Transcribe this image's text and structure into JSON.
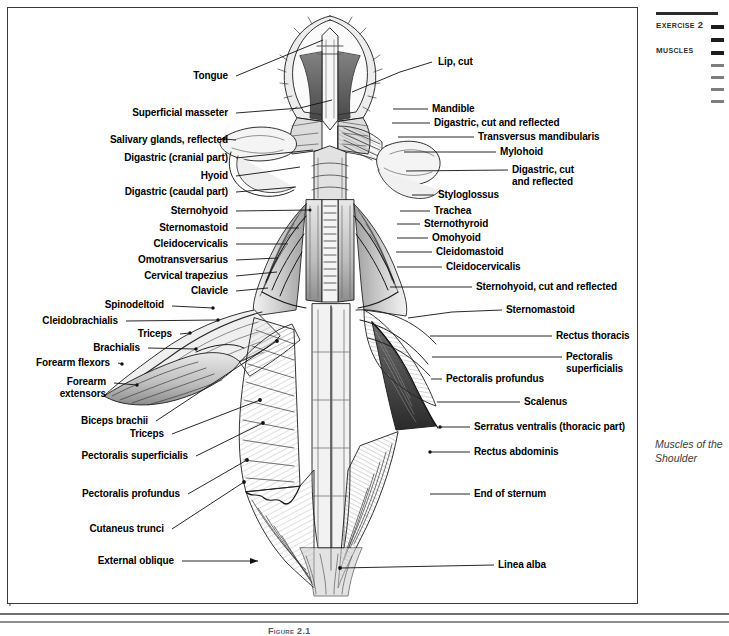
{
  "margin": {
    "exercise": "Exercise 2",
    "section": "Muscles",
    "side_caption": "Muscles of the Shoulder"
  },
  "figure": {
    "caption": "Figure 2.1",
    "title": "Muscles of the Shoulder"
  },
  "labels_left": [
    {
      "id": "tongue",
      "text": "Tongue",
      "x": 228,
      "y": 76,
      "tip_x": 323,
      "tip_y": 40
    },
    {
      "id": "superficial-masseter",
      "text": "Superficial masseter",
      "x": 228,
      "y": 113,
      "tip_x": 330,
      "tip_y": 100
    },
    {
      "id": "salivary-glands",
      "text": "Salivary glands, reflected",
      "x": 228,
      "y": 140,
      "tip_x": 224,
      "tip_y": 138
    },
    {
      "id": "digastric-cranial",
      "text": "Digastric (cranial part)",
      "x": 228,
      "y": 158,
      "tip_x": 313,
      "tip_y": 150
    },
    {
      "id": "hyoid",
      "text": "Hyoid",
      "x": 228,
      "y": 176,
      "tip_x": 299,
      "tip_y": 167
    },
    {
      "id": "digastric-caudal",
      "text": "Digastric (caudal part)",
      "x": 228,
      "y": 192,
      "tip_x": 296,
      "tip_y": 187
    },
    {
      "id": "sternohyoid-l",
      "text": "Sternohyoid",
      "x": 228,
      "y": 211,
      "tip_x": 310,
      "tip_y": 210
    },
    {
      "id": "sternomastoid-l",
      "text": "Sternomastoid",
      "x": 228,
      "y": 228,
      "tip_x": 299,
      "tip_y": 228
    },
    {
      "id": "cleidocervicalis-l",
      "text": "Cleidocervicalis",
      "x": 228,
      "y": 244,
      "tip_x": 288,
      "tip_y": 244
    },
    {
      "id": "omotransversarius",
      "text": "Omotransversarius",
      "x": 228,
      "y": 260,
      "tip_x": 278,
      "tip_y": 258
    },
    {
      "id": "cervical-trapezius",
      "text": "Cervical trapezius",
      "x": 228,
      "y": 276,
      "tip_x": 277,
      "tip_y": 272
    },
    {
      "id": "clavicle",
      "text": "Clavicle",
      "x": 228,
      "y": 291,
      "tip_x": 268,
      "tip_y": 288
    },
    {
      "id": "spinodeltoid",
      "text": "Spinodeltoid",
      "x": 164,
      "y": 305,
      "tip_x": 213,
      "tip_y": 307
    },
    {
      "id": "cleidobrachialis",
      "text": "Cleidobrachialis",
      "x": 118,
      "y": 321,
      "tip_x": 218,
      "tip_y": 320
    },
    {
      "id": "triceps-upper",
      "text": "Triceps",
      "x": 172,
      "y": 334,
      "tip_x": 185,
      "tip_y": 333
    },
    {
      "id": "brachialis",
      "text": "Brachialis",
      "x": 140,
      "y": 348,
      "tip_x": 196,
      "tip_y": 349
    },
    {
      "id": "forearm-flexors",
      "text": "Forearm flexors",
      "x": 110,
      "y": 363,
      "tip_x": 120,
      "tip_y": 364
    },
    {
      "id": "forearm-extensors",
      "text": "Forearm\nextensors",
      "x": 106,
      "y": 382,
      "tip_x": 137,
      "tip_y": 385
    },
    {
      "id": "biceps-brachii",
      "text": "Biceps brachii",
      "x": 148,
      "y": 421,
      "tip_x": 277,
      "tip_y": 341
    },
    {
      "id": "triceps-lower",
      "text": "Triceps",
      "x": 164,
      "y": 434,
      "tip_x": 260,
      "tip_y": 400
    },
    {
      "id": "pectoralis-superficialis-l",
      "text": "Pectoralis superficialis",
      "x": 188,
      "y": 456,
      "tip_x": 263,
      "tip_y": 423
    },
    {
      "id": "pectoralis-profundus-l",
      "text": "Pectoralis profundus",
      "x": 180,
      "y": 494,
      "tip_x": 247,
      "tip_y": 460
    },
    {
      "id": "cutaneus-trunci",
      "text": "Cutaneus trunci",
      "x": 164,
      "y": 529,
      "tip_x": 244,
      "tip_y": 482
    },
    {
      "id": "external-oblique",
      "text": "External oblique",
      "x": 174,
      "y": 561,
      "tip_x": 258,
      "tip_y": 561
    }
  ],
  "labels_right": [
    {
      "id": "lip-cut",
      "text": "Lip, cut",
      "x": 438,
      "y": 62,
      "tip_x": 352,
      "tip_y": 92
    },
    {
      "id": "mandible",
      "text": "Mandible",
      "x": 432,
      "y": 109,
      "tip_x": 393,
      "tip_y": 109
    },
    {
      "id": "digastric-cut-1",
      "text": "Digastric, cut and reflected",
      "x": 434,
      "y": 123,
      "tip_x": 392,
      "tip_y": 123
    },
    {
      "id": "transversus-mandibularis",
      "text": "Transversus mandibularis",
      "x": 478,
      "y": 137,
      "tip_x": 398,
      "tip_y": 137
    },
    {
      "id": "mylohoid",
      "text": "Mylohoid",
      "x": 500,
      "y": 152,
      "tip_x": 404,
      "tip_y": 152
    },
    {
      "id": "digastric-cut-2",
      "text": "Digastric, cut\nand reflected",
      "x": 512,
      "y": 170,
      "tip_x": 406,
      "tip_y": 171
    },
    {
      "id": "styloglossus",
      "text": "Styloglossus",
      "x": 438,
      "y": 195,
      "tip_x": 412,
      "tip_y": 195
    },
    {
      "id": "trachea",
      "text": "Trachea",
      "x": 434,
      "y": 211,
      "tip_x": 400,
      "tip_y": 211
    },
    {
      "id": "sternothyroid",
      "text": "Sternothyroid",
      "x": 424,
      "y": 224,
      "tip_x": 397,
      "tip_y": 224
    },
    {
      "id": "omohyoid",
      "text": "Omohyoid",
      "x": 432,
      "y": 238,
      "tip_x": 397,
      "tip_y": 238
    },
    {
      "id": "cleidomastoid",
      "text": "Cleidomastoid",
      "x": 436,
      "y": 252,
      "tip_x": 396,
      "tip_y": 252
    },
    {
      "id": "cleidocervicalis-r",
      "text": "Cleidocervicalis",
      "x": 446,
      "y": 267,
      "tip_x": 397,
      "tip_y": 267
    },
    {
      "id": "sternohyoid-cut",
      "text": "Sternohyoid, cut and reflected",
      "x": 476,
      "y": 287,
      "tip_x": 390,
      "tip_y": 287
    },
    {
      "id": "sternomastoid-r",
      "text": "Sternomastoid",
      "x": 506,
      "y": 310,
      "tip_x": 408,
      "tip_y": 316
    },
    {
      "id": "rectus-thoracis",
      "text": "Rectus thoracis",
      "x": 556,
      "y": 336,
      "tip_x": 430,
      "tip_y": 336
    },
    {
      "id": "pectoralis-superficialis-r",
      "text": "Pectoralis\nsuperficialis",
      "x": 566,
      "y": 357,
      "tip_x": 432,
      "tip_y": 357
    },
    {
      "id": "pectoralis-profundus-r",
      "text": "Pectoralis profundus",
      "x": 446,
      "y": 379,
      "tip_x": 431,
      "tip_y": 379
    },
    {
      "id": "scalenus",
      "text": "Scalenus",
      "x": 524,
      "y": 402,
      "tip_x": 437,
      "tip_y": 402
    },
    {
      "id": "serratus-ventralis",
      "text": "Serratus ventralis (thoracic part)",
      "x": 474,
      "y": 427,
      "tip_x": 440,
      "tip_y": 427
    },
    {
      "id": "rectus-abdominis",
      "text": "Rectus abdominis",
      "x": 474,
      "y": 452,
      "tip_x": 430,
      "tip_y": 452
    },
    {
      "id": "end-of-sternum",
      "text": "End of sternum",
      "x": 474,
      "y": 494,
      "tip_x": 430,
      "tip_y": 494
    },
    {
      "id": "linea-alba",
      "text": "Linea alba",
      "x": 498,
      "y": 565,
      "tip_x": 340,
      "tip_y": 568
    }
  ],
  "tab_marks": [
    {
      "id": "tab-1",
      "style": "dark"
    },
    {
      "id": "tab-2",
      "style": "dark"
    },
    {
      "id": "tab-3",
      "style": "dark"
    },
    {
      "id": "tab-4",
      "style": "light"
    },
    {
      "id": "tab-5",
      "style": "light"
    },
    {
      "id": "tab-6",
      "style": "light"
    },
    {
      "id": "tab-7",
      "style": "light"
    }
  ],
  "colors": {
    "frame": "#3a3a3a",
    "ink": "#000000",
    "rule": "#6f6f6f",
    "margin_text": "#2e2e2e"
  }
}
